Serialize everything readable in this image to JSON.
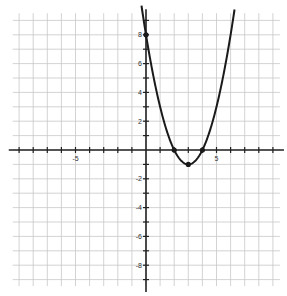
{
  "chart_data": {
    "type": "line",
    "title": "",
    "xlabel": "",
    "ylabel": "",
    "function": "y = x^2 - 6x + 8",
    "xlim": [
      -9.5,
      9.5
    ],
    "ylim": [
      -9.5,
      9.5
    ],
    "grid": true,
    "x_tick_labels": [
      {
        "value": -5,
        "label": "-5"
      },
      {
        "value": 5,
        "label": "5"
      }
    ],
    "y_tick_labels": [
      {
        "value": 8,
        "label": "8"
      },
      {
        "value": 6,
        "label": "6"
      },
      {
        "value": 4,
        "label": "4"
      },
      {
        "value": 2,
        "label": "2"
      },
      {
        "value": -2,
        "label": "-2"
      },
      {
        "value": -4,
        "label": "-4"
      },
      {
        "value": -6,
        "label": "-6"
      },
      {
        "value": -8,
        "label": "-8"
      }
    ],
    "series": [
      {
        "name": "parabola",
        "x": [
          -0.3,
          0,
          1,
          2,
          3,
          4,
          5,
          6,
          6.3
        ],
        "y": [
          9.89,
          8,
          3,
          0,
          -1,
          0,
          3,
          8,
          9.89
        ]
      }
    ],
    "marked_points": [
      {
        "label": "y-intercept",
        "x": 0,
        "y": 8
      },
      {
        "label": "root",
        "x": 2,
        "y": 0
      },
      {
        "label": "vertex",
        "x": 3,
        "y": -1
      },
      {
        "label": "root",
        "x": 4,
        "y": 0
      }
    ],
    "colors": {
      "grid": "#c8c8c8",
      "axis": "#222222",
      "curve": "#1a1a1a"
    }
  }
}
